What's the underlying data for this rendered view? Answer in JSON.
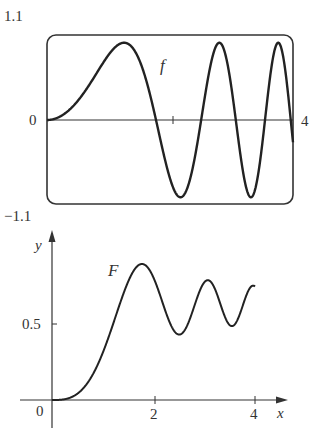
{
  "chart_data": [
    {
      "type": "line",
      "name": "f",
      "title": "",
      "series": [
        {
          "name": "f",
          "label": "f"
        }
      ],
      "function": "f(x) = sin(x^2)",
      "xlim": [
        0,
        4
      ],
      "ylim": [
        -1.1,
        1.1
      ],
      "tick_labels": {
        "y_top": "1.1",
        "y_bottom": "−1.1",
        "origin": "0",
        "x_right": "4"
      },
      "x_ticks": [
        2
      ],
      "grid": false,
      "frame": "rounded-rectangle",
      "x": [
        0,
        0.5,
        1.0,
        1.25,
        1.5,
        1.77,
        2.0,
        2.17,
        2.5,
        2.8,
        3.0,
        3.07,
        3.3,
        3.54,
        3.75,
        3.96,
        4.0
      ],
      "values": [
        0,
        0.25,
        0.84,
        1.0,
        0.78,
        0.0,
        -0.76,
        -1.0,
        0.03,
        1.0,
        0.41,
        0.0,
        -0.99,
        0.0,
        0.99,
        0.0,
        -0.29
      ]
    },
    {
      "type": "line",
      "name": "F",
      "title": "",
      "series": [
        {
          "name": "F",
          "label": "F"
        }
      ],
      "function": "F(x) = ∫₀ˣ sin(t²) dt",
      "xlabel": "x",
      "ylabel": "y",
      "xlim": [
        0,
        4
      ],
      "ylim": [
        0,
        0.95
      ],
      "x_ticks": [
        0,
        2,
        4
      ],
      "y_ticks": [
        0.5
      ],
      "tick_labels": {
        "origin": "0",
        "x": [
          "2",
          "4"
        ],
        "y": [
          "0.5"
        ]
      },
      "grid": false,
      "x": [
        0,
        0.5,
        1.0,
        1.5,
        1.77,
        2.0,
        2.5,
        2.8,
        3.07,
        3.3,
        3.54,
        3.75,
        4.0
      ],
      "values": [
        0,
        0.04,
        0.31,
        0.78,
        0.89,
        0.8,
        0.43,
        0.63,
        0.75,
        0.6,
        0.49,
        0.6,
        0.75
      ]
    }
  ],
  "top_plot": {
    "curve_label": "f",
    "y_max_label": "1.1",
    "y_min_label": "−1.1",
    "origin_label": "0",
    "x_max_label": "4"
  },
  "bottom_plot": {
    "curve_label": "F",
    "y_axis_label": "y",
    "x_axis_label": "x",
    "origin_label": "0",
    "y_tick_label": "0.5",
    "x_tick_labels": [
      "2",
      "4"
    ]
  }
}
